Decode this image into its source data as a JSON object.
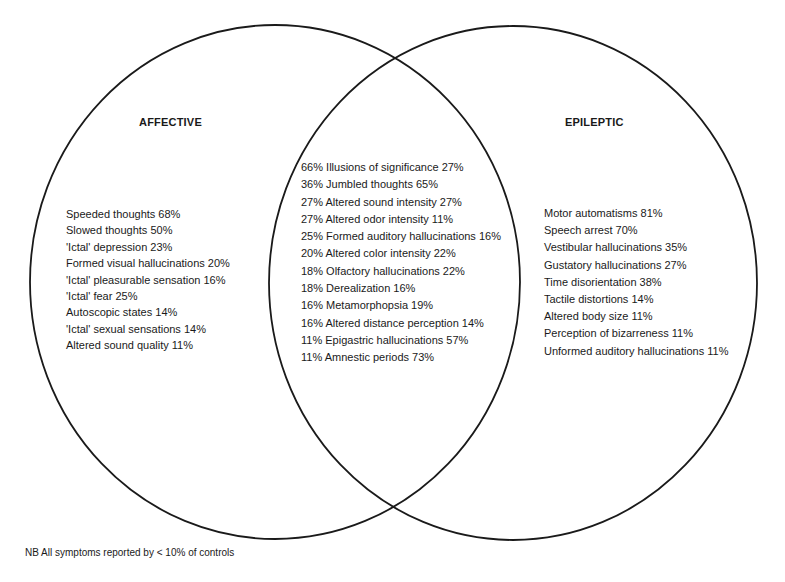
{
  "diagram": {
    "type": "venn",
    "sets": [
      {
        "name": "AFFECTIVE",
        "color": "#1a1a1a"
      },
      {
        "name": "EPILEPTIC",
        "color": "#1a1a1a"
      }
    ],
    "affective_only": [
      "Speeded thoughts 68%",
      "Slowed thoughts 50%",
      "'Ictal' depression 23%",
      "Formed visual hallucinations 20%",
      "'Ictal' pleasurable sensation 16%",
      "'Ictal' fear 25%",
      "Autoscopic states 14%",
      "'Ictal' sexual sensations 14%",
      "Altered sound quality 11%"
    ],
    "overlap": [
      "66% Illusions of significance 27%",
      "36% Jumbled thoughts 65%",
      "27% Altered sound intensity 27%",
      "27% Altered odor intensity 11%",
      "25% Formed auditory hallucinations 16%",
      "20% Altered color intensity 22%",
      "18% Olfactory hallucinations 22%",
      "18% Derealization 16%",
      "16% Metamorphopsia 19%",
      "16% Altered distance perception 14%",
      "11% Epigastric hallucinations 57%",
      "11% Amnestic periods 73%"
    ],
    "epileptic_only": [
      "Motor automatisms 81%",
      "Speech arrest 70%",
      "Vestibular hallucinations 35%",
      "Gustatory hallucinations 27%",
      "Time disorientation 38%",
      "Tactile distortions 14%",
      "Altered body size 11%",
      "Perception of bizarreness 11%",
      "Unformed auditory hallucinations 11%"
    ],
    "footnote": "NB All symptoms reported by < 10% of controls"
  }
}
